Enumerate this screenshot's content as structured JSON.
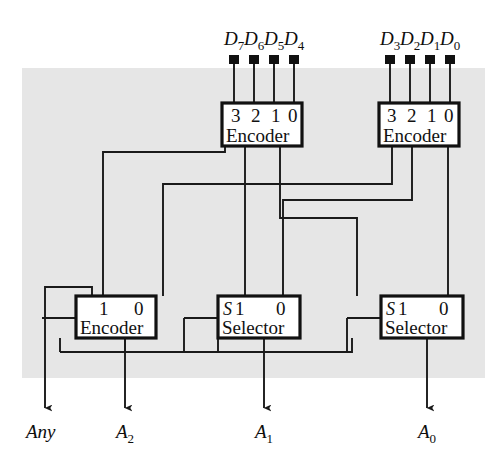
{
  "figure": {
    "background_color": "#e6e6e6",
    "page_color": "#ffffff",
    "wire_color": "#1a1a1a"
  },
  "inputs": {
    "left_group_label": "D7D6D5D4",
    "right_group_label": "D3D2D1D0",
    "left_pins": [
      {
        "base": "D",
        "sub": "7"
      },
      {
        "base": "D",
        "sub": "6"
      },
      {
        "base": "D",
        "sub": "5"
      },
      {
        "base": "D",
        "sub": "4"
      }
    ],
    "right_pins": [
      {
        "base": "D",
        "sub": "3"
      },
      {
        "base": "D",
        "sub": "2"
      },
      {
        "base": "D",
        "sub": "1"
      },
      {
        "base": "D",
        "sub": "0"
      }
    ]
  },
  "blocks": [
    {
      "id": "encoder-high",
      "name": "Encoder",
      "pins": [
        "3",
        "2",
        "1",
        "0"
      ],
      "body_label": "Encoder"
    },
    {
      "id": "encoder-low",
      "name": "Encoder",
      "pins": [
        "3",
        "2",
        "1",
        "0"
      ],
      "body_label": "Encoder"
    },
    {
      "id": "encoder-merge",
      "name": "Encoder",
      "pins": [
        "1",
        "0"
      ],
      "body_label": "Encoder"
    },
    {
      "id": "selector-a1",
      "name": "Selector",
      "select_pin": "S",
      "pins": [
        "1",
        "0"
      ],
      "body_label": "Selector"
    },
    {
      "id": "selector-a0",
      "name": "Selector",
      "select_pin": "S",
      "pins": [
        "1",
        "0"
      ],
      "body_label": "Selector"
    }
  ],
  "outputs": [
    {
      "base": "Any",
      "sub": ""
    },
    {
      "base": "A",
      "sub": "2"
    },
    {
      "base": "A",
      "sub": "1"
    },
    {
      "base": "A",
      "sub": "0"
    }
  ]
}
